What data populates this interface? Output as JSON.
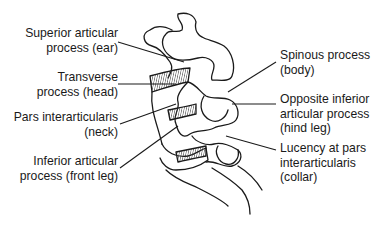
{
  "diagram": {
    "labels_left": [
      {
        "id": "superior-articular-process",
        "line1": "Superior articular",
        "line2": "process (ear)"
      },
      {
        "id": "transverse-process",
        "line1": "Transverse",
        "line2": "process (head)"
      },
      {
        "id": "pars-interarticularis",
        "line1": "Pars interarticularis",
        "line2": "(neck)"
      },
      {
        "id": "inferior-articular-process",
        "line1": "Inferior articular",
        "line2": "process (front leg)"
      }
    ],
    "labels_right": [
      {
        "id": "spinous-process",
        "line1": "Spinous process",
        "line2": "(body)"
      },
      {
        "id": "opposite-inferior-articular-process",
        "line1": "Opposite inferior",
        "line2": "articular process",
        "line3": "(hind leg)"
      },
      {
        "id": "lucency-pars",
        "line1": "Lucency at pars",
        "line2": "interarticularis",
        "line3": "(collar)"
      }
    ],
    "colors": {
      "stroke": "#1a1a1a",
      "hatch": "#333333",
      "background": "#ffffff"
    }
  }
}
